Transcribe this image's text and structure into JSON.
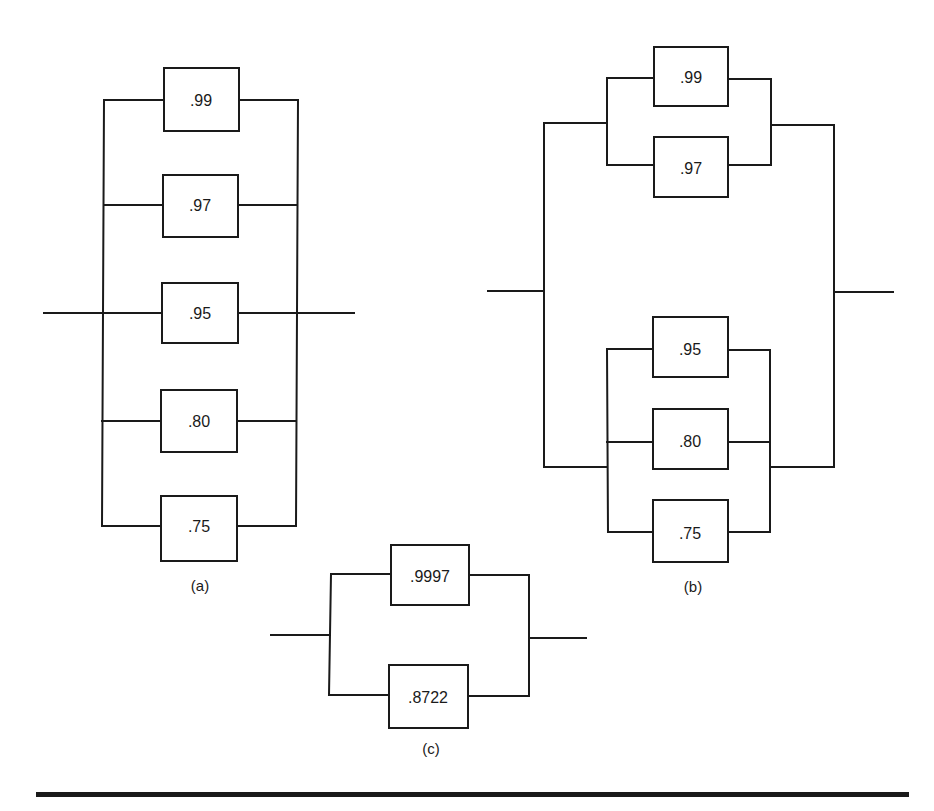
{
  "diagram_a": {
    "caption": "(a)",
    "components": [
      {
        "value": ".99"
      },
      {
        "value": ".97"
      },
      {
        "value": ".95"
      },
      {
        "value": ".80"
      },
      {
        "value": ".75"
      }
    ]
  },
  "diagram_b": {
    "caption": "(b)",
    "upper_group": [
      {
        "value": ".99"
      },
      {
        "value": ".97"
      }
    ],
    "lower_group": [
      {
        "value": ".95"
      },
      {
        "value": ".80"
      },
      {
        "value": ".75"
      }
    ]
  },
  "diagram_c": {
    "caption": "(c)",
    "components": [
      {
        "value": ".9997"
      },
      {
        "value": ".8722"
      }
    ]
  },
  "colors": {
    "line": "#1a1a1a",
    "background": "#ffffff"
  }
}
